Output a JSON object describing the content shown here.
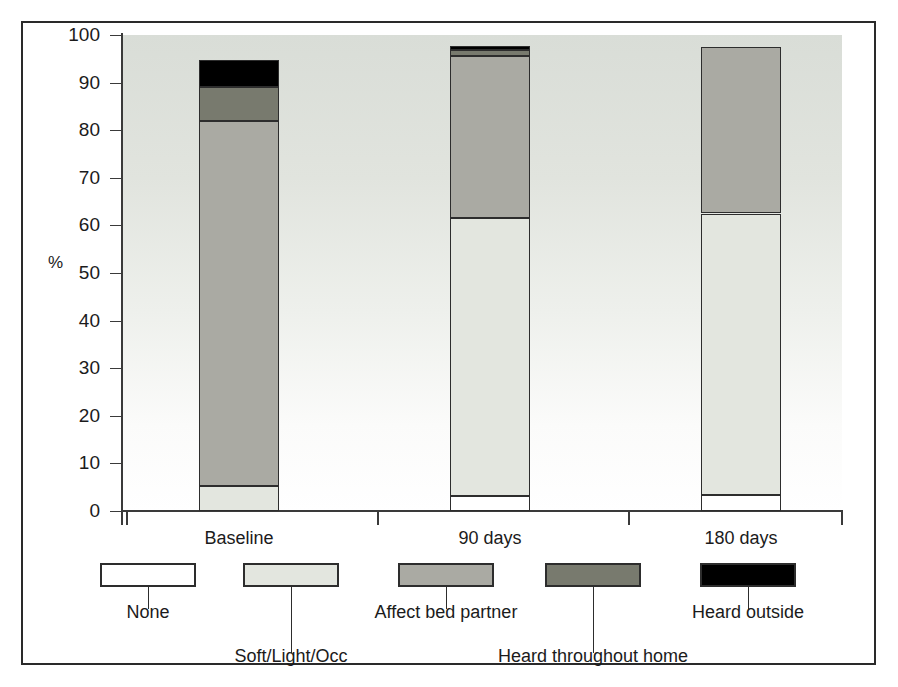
{
  "chart_data": {
    "type": "bar",
    "subtype": "stacked-bar-100",
    "title": "",
    "xlabel": "",
    "ylabel": "%",
    "ylim": [
      0,
      100
    ],
    "yticks": [
      0,
      10,
      20,
      30,
      40,
      50,
      60,
      70,
      80,
      90,
      100
    ],
    "grid": false,
    "legend_position": "bottom",
    "categories": [
      "Baseline",
      "90 days",
      "180 days"
    ],
    "series": [
      {
        "name": "None",
        "color": "#ffffff",
        "values": [
          0,
          3.2,
          3.3
        ]
      },
      {
        "name": "Soft/Light/Occ",
        "color": "#e3e6df",
        "values": [
          5.3,
          58.3,
          59.2
        ]
      },
      {
        "name": "Affect bed partner",
        "color": "#aaaaa3",
        "values": [
          76.7,
          34.0,
          35.0
        ]
      },
      {
        "name": "Heard throughout home",
        "color": "#787a6e",
        "values": [
          7.0,
          1.3,
          0
        ]
      },
      {
        "name": "Heard outside",
        "color": "#000000",
        "values": [
          5.8,
          0.9,
          0
        ]
      }
    ],
    "stack_tops": {
      "Baseline": [
        0,
        5.3,
        82.0,
        89.0,
        94.8
      ],
      "90 days": [
        3.2,
        61.5,
        95.5,
        96.8,
        97.7
      ],
      "180 days": [
        3.3,
        62.5,
        97.5,
        97.5,
        97.5
      ]
    }
  },
  "axis": {
    "y_title": "%",
    "y_tick_labels": [
      "100",
      "90",
      "80",
      "70",
      "60",
      "50",
      "40",
      "30",
      "20",
      "10",
      "0"
    ],
    "x_tick_labels": [
      "Baseline",
      "90 days",
      "180 days"
    ]
  },
  "legend": {
    "items": [
      {
        "label": "None",
        "color": "#ffffff"
      },
      {
        "label": "Soft/Light/Occ",
        "color": "#e3e6df"
      },
      {
        "label": "Affect bed partner",
        "color": "#aaaaa3"
      },
      {
        "label": "Heard throughout home",
        "color": "#787a6e"
      },
      {
        "label": "Heard outside",
        "color": "#000000"
      }
    ]
  },
  "colors": {
    "frame_border": "#2a2a2a",
    "axis": "#3a3a3a",
    "text": "#1b1b1b",
    "plot_bg_top": "#d9ddd7",
    "plot_bg_bottom": "#ffffff",
    "bar_outline": "#2d2d2d"
  }
}
